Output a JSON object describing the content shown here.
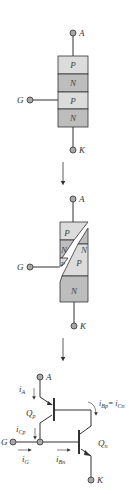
{
  "colors": {
    "p_layer": "#dcdcdc",
    "n_layer": "#bdbdbd",
    "terminal_fill": "#a8a8a8",
    "line": "#333333"
  },
  "panel1": {
    "anode_label": "A",
    "gate_label": "G",
    "cathode_label": "K",
    "layers": [
      "P",
      "N",
      "P",
      "N"
    ]
  },
  "panel2": {
    "anode_label": "A",
    "gate_label": "G",
    "cathode_label": "K",
    "left_layers": [
      "P",
      "N",
      "P"
    ],
    "right_layers": [
      "N",
      "P",
      "N"
    ]
  },
  "panel3": {
    "anode_label": "A",
    "gate_label": "G",
    "cathode_label": "K",
    "pnp_label": "Q",
    "pnp_sub": "p",
    "npn_label": "Q",
    "npn_sub": "n",
    "currents": {
      "i_a": {
        "main": "i",
        "sub": "A"
      },
      "i_cp": {
        "main": "i",
        "sub": "Cp"
      },
      "i_g": {
        "main": "i",
        "sub": "G"
      },
      "i_bn": {
        "main": "i",
        "sub": "Bn"
      },
      "i_bp_eq": {
        "main": "i",
        "sub": "Bp",
        "eq": "= i",
        "sub2": "Cn"
      }
    }
  }
}
